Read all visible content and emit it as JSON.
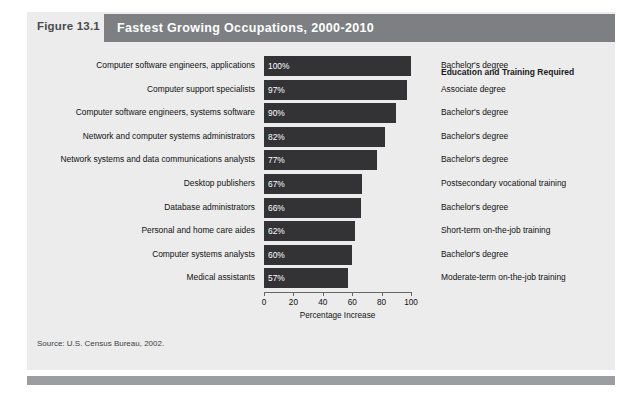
{
  "figure": {
    "number": "Figure 13.1",
    "title": "Fastest Growing Occupations, 2000-2010",
    "source": "Source: U.S. Census Bureau, 2002.",
    "education_header": "Education and Training Required"
  },
  "colors": {
    "panel_background": "#ececed",
    "title_bar": "#7d7f82",
    "bar_fill": "#333335",
    "footer_bar": "#9b9da0",
    "bar_value_text": "#ffffff"
  },
  "chart_data": {
    "type": "bar",
    "orientation": "horizontal",
    "title": "Fastest Growing Occupations, 2000-2010",
    "xlabel": "Percentage Increase",
    "ylabel": "",
    "xlim": [
      0,
      100
    ],
    "xticks": [
      0,
      20,
      40,
      60,
      80,
      100
    ],
    "grid": false,
    "legend": false,
    "categories": [
      "Computer software engineers, applications",
      "Computer support specialists",
      "Computer software engineers, systems software",
      "Network and computer systems administrators",
      "Network systems and data communications analysts",
      "Desktop publishers",
      "Database administrators",
      "Personal and home care aides",
      "Computer systems analysts",
      "Medical assistants"
    ],
    "values": [
      100,
      97,
      90,
      82,
      77,
      67,
      66,
      62,
      60,
      57
    ],
    "value_labels": [
      "100%",
      "97%",
      "90%",
      "82%",
      "77%",
      "67%",
      "66%",
      "62%",
      "60%",
      "57%"
    ],
    "annotations": [
      "Bachelor's degree",
      "Associate degree",
      "Bachelor's degree",
      "Bachelor's degree",
      "Bachelor's degree",
      "Postsecondary vocational training",
      "Bachelor's degree",
      "Short-term on-the-job training",
      "Bachelor's degree",
      "Moderate-term on-the-job training"
    ]
  }
}
